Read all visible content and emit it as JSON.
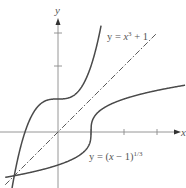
{
  "figure": {
    "x_axis_label": "x",
    "y_axis_label": "y",
    "curves": [
      {
        "name": "cubic",
        "label_prefix": "y = ",
        "label_var": "x",
        "label_sup": "3",
        "label_suffix": " + 1",
        "expression": "x^3 + 1"
      },
      {
        "name": "cube-root",
        "label_prefix": "y = (",
        "label_var": "x",
        "label_mid": " − 1)",
        "label_sup": "1/3",
        "expression": "(x - 1)^(1/3)"
      },
      {
        "name": "identity",
        "expression": "x",
        "style": "dash-dot"
      }
    ],
    "x_ticks": [
      1,
      2,
      3
    ],
    "y_ticks": [
      2,
      3
    ],
    "origin_px": [
      58,
      132
    ],
    "unit_px": 33,
    "colors": {
      "curve": "#4a4a4a",
      "axis": "#8a8a8a",
      "text": "#555555"
    }
  }
}
